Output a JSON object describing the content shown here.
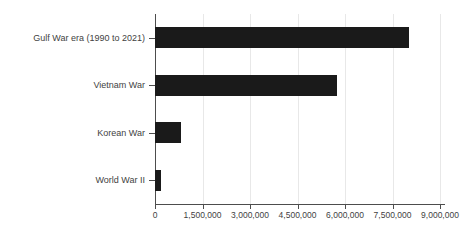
{
  "chart_data": {
    "type": "bar",
    "orientation": "horizontal",
    "title": "",
    "subtitle": "",
    "xlabel": "",
    "ylabel": "",
    "categories": [
      "Gulf War era (1990 to 2021)",
      "Vietnam War",
      "Korean War",
      "World War II"
    ],
    "values": [
      8020000,
      5750000,
      820000,
      190000
    ],
    "series": [
      {
        "name": "Veterans",
        "values": [
          8020000,
          5750000,
          820000,
          190000
        ]
      }
    ],
    "xlim": [
      0,
      9450000
    ],
    "ylim": [
      0,
      4
    ],
    "xticks": [
      0,
      1500000,
      3000000,
      4500000,
      6000000,
      7500000,
      9000000
    ],
    "xtick_labels": [
      "0",
      "1,500,000",
      "3,000,000",
      "4,500,000",
      "6,000,000",
      "7,500,000",
      "9,000,000"
    ],
    "grid": true,
    "grid_axis": "x",
    "legend": false,
    "legend_position": "none",
    "bar_color": "#1a1a1a",
    "grid_color": "#e8e8e8",
    "axis_color": "#4d4d4d",
    "text_color": "#3f3f3f",
    "background_color": "#ffffff"
  }
}
